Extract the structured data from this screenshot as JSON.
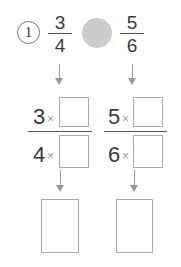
{
  "problem": {
    "number": "1",
    "left_fraction": {
      "numerator": "3",
      "denominator": "4"
    },
    "right_fraction": {
      "numerator": "5",
      "denominator": "6"
    },
    "compare_symbol": ""
  },
  "conversion": {
    "left": {
      "numerator": "3",
      "denominator": "4",
      "operator": "×",
      "numerator_blank": "",
      "denominator_blank": ""
    },
    "right": {
      "numerator": "5",
      "denominator": "6",
      "operator": "×",
      "numerator_blank": "",
      "denominator_blank": ""
    }
  },
  "answers": {
    "left": "",
    "right": ""
  },
  "colors": {
    "compare_circle": "#cccccc",
    "arrow": "#9a9a9a",
    "box_border": "#aaaaaa"
  }
}
